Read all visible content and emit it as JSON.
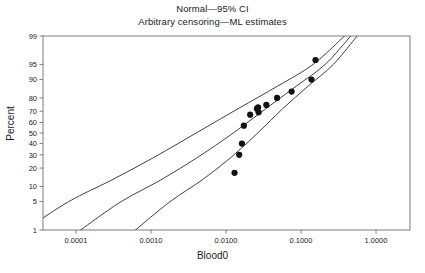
{
  "title": {
    "line1": "Normal—95% CI",
    "line2": "Arbitrary censoring—ML estimates"
  },
  "axes": {
    "xlabel": "Blood0",
    "ylabel": "Percent",
    "x_ticks": [
      "0.0001",
      "0.0010",
      "0.0100",
      "0.1000",
      "1.0000"
    ],
    "y_ticks": [
      "99",
      "95",
      "90",
      "80",
      "70",
      "60",
      "50",
      "40",
      "30",
      "20",
      "10",
      "5",
      "1"
    ]
  },
  "style": {
    "line_color": "#2b2b2b",
    "marker_color": "#111111",
    "frame_color": "#6e6e6e",
    "background": "#ffffff"
  },
  "chart_data": {
    "type": "scatter",
    "title": "Normal—95% CI",
    "subtitle": "Arbitrary censoring—ML estimates",
    "xlabel": "Blood0",
    "ylabel": "Percent",
    "x_scale": "log10",
    "y_scale": "normal-probability",
    "xlim": [
      3e-05,
      2.6
    ],
    "ylim": [
      1,
      99
    ],
    "x_tick_values": [
      0.0001,
      0.001,
      0.01,
      0.1,
      1.0
    ],
    "x_tick_labels": [
      "0.0001",
      "0.0010",
      "0.0100",
      "0.1000",
      "1.0000"
    ],
    "y_tick_values": [
      99,
      95,
      90,
      80,
      70,
      60,
      50,
      40,
      30,
      20,
      10,
      5,
      1
    ],
    "y_tick_labels": [
      "99",
      "95",
      "90",
      "80",
      "70",
      "60",
      "50",
      "40",
      "30",
      "20",
      "10",
      "5",
      "1"
    ],
    "grid": false,
    "legend": false,
    "points": [
      {
        "x": 0.013,
        "y": 17
      },
      {
        "x": 0.015,
        "y": 30
      },
      {
        "x": 0.0163,
        "y": 40
      },
      {
        "x": 0.0173,
        "y": 57
      },
      {
        "x": 0.021,
        "y": 67
      },
      {
        "x": 0.0258,
        "y": 72
      },
      {
        "x": 0.0268,
        "y": 73
      },
      {
        "x": 0.0272,
        "y": 69
      },
      {
        "x": 0.0345,
        "y": 75
      },
      {
        "x": 0.048,
        "y": 80
      },
      {
        "x": 0.075,
        "y": 84
      },
      {
        "x": 0.138,
        "y": 90
      },
      {
        "x": 0.156,
        "y": 96
      }
    ],
    "series": [
      {
        "name": "ML fit line",
        "type": "line",
        "x": [
          0.000115,
          0.0004,
          0.00135,
          0.0042,
          0.0125,
          0.034,
          0.087,
          0.21,
          0.46
        ],
        "y": [
          1,
          5,
          13,
          28,
          50,
          72,
          87,
          95,
          99
        ]
      },
      {
        "name": "Lower 95% CI",
        "type": "line",
        "x": [
          2.1e-05,
          8e-05,
          0.0003,
          0.0011,
          0.004,
          0.0145,
          0.049,
          0.145,
          0.38
        ],
        "y": [
          1,
          5,
          13,
          28,
          50,
          72,
          87,
          95,
          99
        ]
      },
      {
        "name": "Upper 95% CI",
        "type": "line",
        "x": [
          0.00062,
          0.0018,
          0.0048,
          0.0117,
          0.0265,
          0.057,
          0.125,
          0.27,
          0.56
        ],
        "y": [
          1,
          5,
          13,
          28,
          50,
          72,
          87,
          95,
          99
        ]
      }
    ]
  }
}
